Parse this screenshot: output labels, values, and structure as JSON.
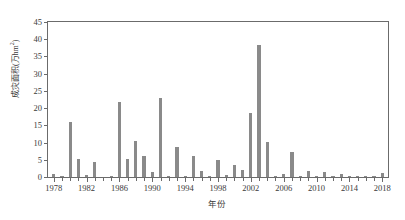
{
  "chart_data": {
    "type": "bar",
    "title": "",
    "xlabel": "年份",
    "ylabel": "成灾面积(万hm²)",
    "ylabel_main": "成灾面积(万hm",
    "ylabel_sup": "2",
    "ylabel_tail": ")",
    "xlim": [
      1977.3,
      2018.7
    ],
    "ylim": [
      0,
      45
    ],
    "ytick_step": 5,
    "yticks": [
      0,
      5,
      10,
      15,
      20,
      25,
      30,
      35,
      40,
      45
    ],
    "ytick_labels": [
      "0",
      "5",
      "10",
      "15",
      "20",
      "25",
      "30",
      "35",
      "40",
      "45"
    ],
    "xtick_labels": [
      "1978",
      "1982",
      "1986",
      "1990",
      "1994",
      "1998",
      "2002",
      "2006",
      "2010",
      "2014",
      "2018"
    ],
    "xtick_values": [
      1978,
      1982,
      1986,
      1990,
      1994,
      1998,
      2002,
      2006,
      2010,
      2014,
      2018
    ],
    "grid": false,
    "legend": null,
    "bar_color": "#8a8a8a",
    "axis_color": "#6b6b6b",
    "categories": [
      1978,
      1979,
      1980,
      1981,
      1982,
      1983,
      1984,
      1985,
      1986,
      1987,
      1988,
      1989,
      1990,
      1991,
      1992,
      1993,
      1994,
      1995,
      1996,
      1997,
      1998,
      1999,
      2000,
      2001,
      2002,
      2003,
      2004,
      2005,
      2006,
      2007,
      2008,
      2009,
      2010,
      2011,
      2012,
      2013,
      2014,
      2015,
      2016,
      2017,
      2018
    ],
    "values": [
      0.9,
      0.05,
      15.9,
      5.1,
      0.5,
      4.3,
      0.0,
      0.05,
      21.7,
      5.1,
      10.4,
      6.1,
      1.6,
      22.9,
      0.1,
      8.6,
      0.3,
      6.2,
      1.8,
      0.15,
      4.8,
      0.5,
      3.4,
      2.0,
      18.7,
      38.3,
      10.3,
      0.2,
      0.8,
      7.4,
      0.15,
      1.8,
      0.1,
      1.4,
      0.1,
      1.0,
      0.05,
      0.05,
      0.05,
      0.4,
      1.1
    ]
  }
}
